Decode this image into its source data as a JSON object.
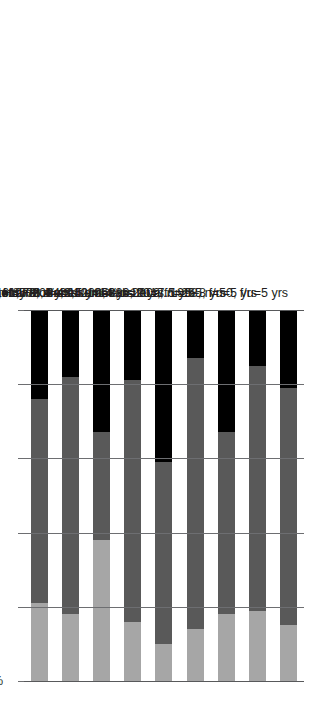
{
  "chart_data": {
    "type": "bar",
    "orientation": "vertical-stacked-rotated",
    "title": "",
    "xlabel": "",
    "ylabel": "",
    "ylim": [
      0,
      100
    ],
    "grid": true,
    "legend": "none",
    "axis_ticks": [
      "0%",
      "20%",
      "40%",
      "60%",
      "80%",
      "100%"
    ],
    "axis_tick_values": [
      0,
      20,
      40,
      60,
      80,
      100
    ],
    "categories": [
      "DeLisi et al. 1998, n=50, f/u=5 yrs",
      "Bertelsen et al. 2009, n=265, f/u=5 yrs",
      "Holmboe et al. 1968, n=201, f/u=5–8 yrs",
      "Henry et al. 2010, n=339, f/u=7.5 yrs",
      "Morgan et al. 2014, n=200, f/u=10 yrs",
      "Bland and Orn 1978, n=43, f/u=14 yrs",
      "Harrison et al. 2001, n=502, f/u=15 yrs",
      "Kaleda 2008, n=278, f/u=16.8 + 6.4 yrs",
      "Average, n=1,778"
    ],
    "series": [
      {
        "name": "segment-1",
        "color": "#000000",
        "values": [
          21,
          15,
          33,
          13,
          41,
          19,
          33,
          18,
          24
        ]
      },
      {
        "name": "segment-2",
        "color": "#595959",
        "values": [
          64,
          66,
          49,
          73,
          49,
          65,
          29,
          64,
          55
        ]
      },
      {
        "name": "segment-3",
        "color": "#a6a6a6",
        "values": [
          15,
          19,
          18,
          14,
          10,
          16,
          38,
          18,
          21
        ]
      }
    ],
    "colors": {
      "segment1": "#000000",
      "segment2": "#595959",
      "segment3": "#a6a6a6",
      "axis": "#58595b",
      "grid": "#6d6e71",
      "text": "#231f20",
      "background": "#ffffff"
    }
  }
}
